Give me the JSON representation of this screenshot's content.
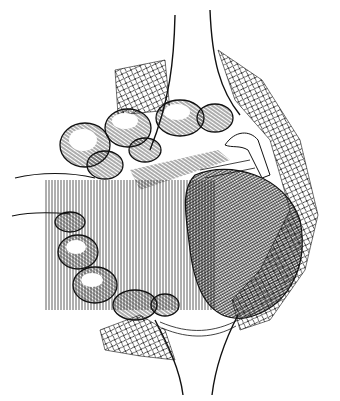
{
  "illustration": {
    "kind": "pen-and-ink anatomical surgical illustration",
    "colors": {
      "ink": "#111111",
      "paper": "#ffffff"
    },
    "regions": [
      "retractor-top",
      "retractor-bottom",
      "gauze-left-top",
      "gauze-right",
      "gauze-bottom-left",
      "bowel-loops",
      "mesentery-fibers",
      "vessel-retracted",
      "organ-mass",
      "sutures"
    ]
  }
}
